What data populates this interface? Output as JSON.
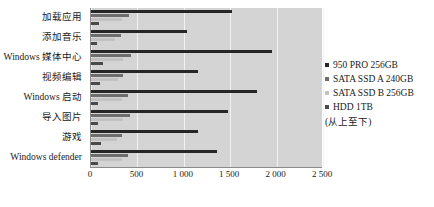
{
  "chart_data": {
    "type": "bar",
    "orientation": "horizontal",
    "title": "",
    "xlabel": "",
    "ylabel": "",
    "xlim": [
      0,
      2500
    ],
    "grid": true,
    "legend_position": "right",
    "legend_note": "(从上至下)",
    "xticks": [
      "0",
      "500",
      "1 000",
      "1 500",
      "2 000",
      "2 500"
    ],
    "xtick_values": [
      0,
      500,
      1000,
      1500,
      2000,
      2500
    ],
    "categories": [
      "加载应用",
      "添加音乐",
      "Windows 媒体中心",
      "视频编辑",
      "Windows 启动",
      "导入图片",
      "游戏",
      "Windows defender"
    ],
    "series": [
      {
        "name": "950 PRO 256GB",
        "color": "#262626",
        "values": [
          1520,
          1030,
          1950,
          1150,
          1790,
          1480,
          1150,
          1360
        ]
      },
      {
        "name": "SATA SSD A 240GB",
        "color": "#6e6e6e",
        "values": [
          410,
          320,
          430,
          350,
          400,
          420,
          330,
          400
        ]
      },
      {
        "name": "SATA SSD B 256GB",
        "color": "#c2c2c2",
        "values": [
          330,
          260,
          350,
          290,
          330,
          350,
          280,
          330
        ]
      },
      {
        "name": "HDD 1TB",
        "color": "#4a4a4a",
        "values": [
          90,
          70,
          130,
          100,
          80,
          80,
          110,
          80
        ]
      }
    ]
  }
}
